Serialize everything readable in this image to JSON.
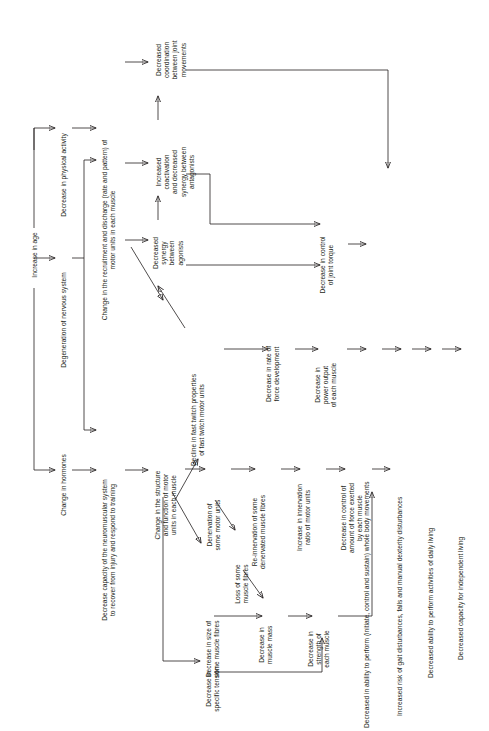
{
  "diagram": {
    "orientation": "text rotated 90 degrees counter-clockwise",
    "line_color": "#231f20",
    "background": "#ffffff",
    "nodes": [
      {
        "id": "n1",
        "label": "Increase in age"
      },
      {
        "id": "n2",
        "label": "Decrease in physical activity"
      },
      {
        "id": "n3",
        "label": "Degeneration of nervous system"
      },
      {
        "id": "n4",
        "label": "Change in hormones"
      },
      {
        "id": "n5",
        "label": "Change in the recruitment and discharge (rate and pattern) of\nmotor units in each muscle"
      },
      {
        "id": "n6",
        "label": "Decrease capacity of the neuromuscular system\nto recover from injury and respond to training"
      },
      {
        "id": "n7",
        "label": "Decreased\ncoordination\nbetween joint\nmovements"
      },
      {
        "id": "n8",
        "label": "Increased\ncoactivation\nand decreased\nsynergy between\nantagonists"
      },
      {
        "id": "n9",
        "label": "Decreased\nsynergy\nbetween\nagonists"
      },
      {
        "id": "n10",
        "label": "Change in the structure\nand function of motor\nunits in each muscle"
      },
      {
        "id": "n11",
        "label": "Decline in fast twitch properties\nof fast twitch motor units"
      },
      {
        "id": "n12",
        "label": "Denervation of\nsome motor units"
      },
      {
        "id": "n13",
        "label": "Re-innervation of some\ndenervated muscle fibres"
      },
      {
        "id": "n14",
        "label": "Increase in innervation\nratio of motor units"
      },
      {
        "id": "n15",
        "label": "Decrease in control of\namount of force exerted\nby each muscle"
      },
      {
        "id": "n16",
        "label": "Loss of some\nmuscle fibres"
      },
      {
        "id": "n17",
        "label": "Decrease in size of\nsome muscle fibres"
      },
      {
        "id": "n18",
        "label": "Decrease in\nmuscle mass"
      },
      {
        "id": "n19",
        "label": "Decrease in\nstrength of\neach muscle"
      },
      {
        "id": "n20",
        "label": "Decrease in\nspecific tension"
      },
      {
        "id": "n21",
        "label": "Decrease in rate of\nforce development"
      },
      {
        "id": "n22",
        "label": "Decrease in\npower output\nof each muscle"
      },
      {
        "id": "n23",
        "label": "Decrease in control\nof joint torque"
      },
      {
        "id": "n24",
        "label": "Decreased in ability to perform (initiate, control and sustain) whole body movements"
      },
      {
        "id": "n25",
        "label": "Increased risk of gait disturbances, falls and manual dexterity disturbances"
      },
      {
        "id": "n26",
        "label": "Decreased ability to perform activities of daily living"
      },
      {
        "id": "n27",
        "label": "Decreased capacity for independent living"
      }
    ]
  }
}
